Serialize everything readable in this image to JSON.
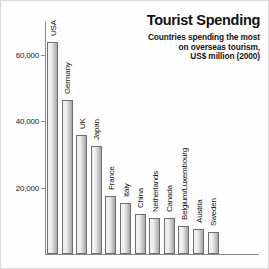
{
  "header": {
    "title": "Tourist Spending",
    "subtitle_lines": [
      "Countries spending the most",
      "on overseas tourism,",
      "US$ million (2000)"
    ]
  },
  "chart_data": {
    "type": "bar",
    "title": "Tourist Spending",
    "subtitle": "Countries spending the most on overseas tourism, US$ million (2000)",
    "xlabel": "",
    "ylabel": "",
    "ylim": [
      0,
      70000
    ],
    "yticks": [
      20000,
      40000,
      60000
    ],
    "ytick_labels": [
      "20,000",
      "40,000",
      "60,000"
    ],
    "grid": false,
    "legend": "none",
    "units": "US$ million",
    "year": "2000",
    "categories": [
      "USA",
      "Germany",
      "UK",
      "Japan",
      "France",
      "Italy",
      "China",
      "Netherlands",
      "Canada",
      "Belgium/Luxembourg",
      "Austria",
      "Sweden"
    ],
    "values": [
      64000,
      46500,
      36000,
      32500,
      17500,
      15500,
      12000,
      11000,
      11000,
      8500,
      7500,
      6500
    ],
    "colors": {
      "bar_light": "#f2f2f2",
      "bar_dark": "#a6a6a6",
      "bar_border": "#6f6f6f",
      "axis": "#8a8a8a",
      "text": "#111111",
      "background": "#ffffff"
    }
  }
}
